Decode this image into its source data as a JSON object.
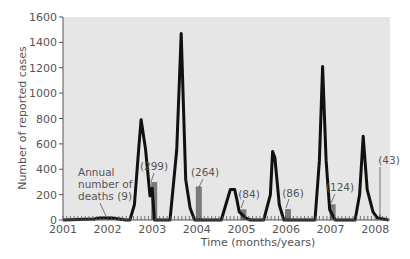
{
  "chart_data": {
    "type": "line",
    "title": "",
    "xlabel": "Time (months/years)",
    "ylabel": "Number of reported cases",
    "ylim": [
      0,
      1600
    ],
    "yticks": [
      0,
      200,
      400,
      600,
      800,
      1000,
      1200,
      1400,
      1600
    ],
    "xticks": [
      "2001",
      "2002",
      "2003",
      "2004",
      "2005",
      "2006",
      "2007",
      "2008"
    ],
    "grid": false,
    "background": "#e6e6e6",
    "series": [
      {
        "name": "Reported cases (monthly)",
        "type": "line",
        "color": "#111111",
        "points": [
          {
            "t": 2001.0,
            "v": 0
          },
          {
            "t": 2001.7,
            "v": 8
          },
          {
            "t": 2001.8,
            "v": 15
          },
          {
            "t": 2002.1,
            "v": 15
          },
          {
            "t": 2002.4,
            "v": 0
          },
          {
            "t": 2002.5,
            "v": 0
          },
          {
            "t": 2002.6,
            "v": 120
          },
          {
            "t": 2002.7,
            "v": 570
          },
          {
            "t": 2002.75,
            "v": 790
          },
          {
            "t": 2002.85,
            "v": 560
          },
          {
            "t": 2002.95,
            "v": 190
          },
          {
            "t": 2003.0,
            "v": 250
          },
          {
            "t": 2003.05,
            "v": 0
          },
          {
            "t": 2003.4,
            "v": 0
          },
          {
            "t": 2003.55,
            "v": 550
          },
          {
            "t": 2003.65,
            "v": 1470
          },
          {
            "t": 2003.75,
            "v": 320
          },
          {
            "t": 2003.85,
            "v": 95
          },
          {
            "t": 2003.95,
            "v": 0
          },
          {
            "t": 2004.55,
            "v": 0
          },
          {
            "t": 2004.65,
            "v": 120
          },
          {
            "t": 2004.75,
            "v": 240
          },
          {
            "t": 2004.85,
            "v": 240
          },
          {
            "t": 2004.9,
            "v": 160
          },
          {
            "t": 2004.95,
            "v": 65
          },
          {
            "t": 2005.1,
            "v": 15
          },
          {
            "t": 2005.2,
            "v": 0
          },
          {
            "t": 2005.5,
            "v": 0
          },
          {
            "t": 2005.65,
            "v": 200
          },
          {
            "t": 2005.7,
            "v": 540
          },
          {
            "t": 2005.75,
            "v": 490
          },
          {
            "t": 2005.85,
            "v": 120
          },
          {
            "t": 2005.95,
            "v": 0
          },
          {
            "t": 2006.65,
            "v": 0
          },
          {
            "t": 2006.75,
            "v": 470
          },
          {
            "t": 2006.82,
            "v": 1210
          },
          {
            "t": 2006.9,
            "v": 470
          },
          {
            "t": 2006.98,
            "v": 80
          },
          {
            "t": 2007.1,
            "v": 0
          },
          {
            "t": 2007.55,
            "v": 0
          },
          {
            "t": 2007.65,
            "v": 200
          },
          {
            "t": 2007.73,
            "v": 660
          },
          {
            "t": 2007.82,
            "v": 240
          },
          {
            "t": 2007.95,
            "v": 65
          },
          {
            "t": 2008.05,
            "v": 15
          },
          {
            "t": 2008.3,
            "v": 0
          }
        ]
      },
      {
        "name": "Annual number of deaths",
        "type": "bar",
        "color": "#7a7a7a",
        "categories": [
          "2002",
          "2003",
          "2004",
          "2005",
          "2006",
          "2007",
          "2008"
        ],
        "values": [
          9,
          299,
          264,
          84,
          86,
          124,
          43
        ]
      }
    ],
    "annotations": [
      {
        "text": "Annual number of deaths (9)",
        "lines": [
          "Annual",
          "number of",
          "deaths (9)"
        ],
        "year": "2002"
      },
      {
        "text": "(299)",
        "year": "2003"
      },
      {
        "text": "(264)",
        "year": "2004"
      },
      {
        "text": "(84)",
        "year": "2005"
      },
      {
        "text": "(86)",
        "year": "2006"
      },
      {
        "text": "(124)",
        "year": "2007"
      },
      {
        "text": "(43)",
        "year": "2008"
      }
    ]
  }
}
